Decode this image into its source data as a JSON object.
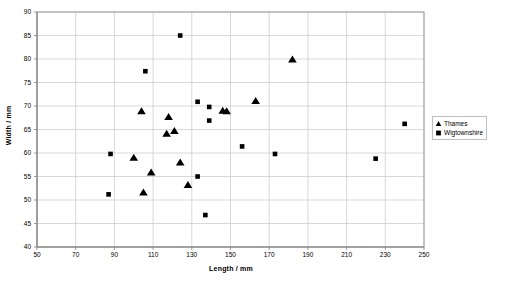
{
  "chart_data": {
    "type": "scatter",
    "title": "",
    "xlabel": "Length / mm",
    "ylabel": "Width / mm",
    "xlim": [
      50,
      250
    ],
    "ylim": [
      40,
      90
    ],
    "xticks": [
      50,
      70,
      90,
      110,
      130,
      150,
      170,
      190,
      210,
      230,
      250
    ],
    "yticks": [
      40,
      45,
      50,
      55,
      60,
      65,
      70,
      75,
      80,
      85,
      90
    ],
    "xtick_step": 20,
    "ytick_step": 5,
    "grid": true,
    "legend_position": "right",
    "series": [
      {
        "name": "Thames",
        "marker": "triangle",
        "color": "#000000",
        "points": [
          [
            104,
            68.8
          ],
          [
            100,
            58.9
          ],
          [
            109,
            55.8
          ],
          [
            105,
            51.5
          ],
          [
            118,
            67.6
          ],
          [
            117,
            64.0
          ],
          [
            121,
            64.6
          ],
          [
            124,
            57.9
          ],
          [
            128,
            53.1
          ],
          [
            148,
            68.8
          ],
          [
            146,
            68.9
          ],
          [
            163,
            71.0
          ],
          [
            182,
            79.8
          ]
        ]
      },
      {
        "name": "Wigtownshire",
        "marker": "square",
        "color": "#000000",
        "points": [
          [
            88,
            59.8
          ],
          [
            87,
            51.2
          ],
          [
            106,
            77.4
          ],
          [
            124,
            85.0
          ],
          [
            133,
            70.9
          ],
          [
            139,
            69.8
          ],
          [
            139,
            66.9
          ],
          [
            133,
            55.0
          ],
          [
            137,
            46.8
          ],
          [
            156,
            61.4
          ],
          [
            173,
            59.8
          ],
          [
            225,
            58.8
          ],
          [
            240,
            66.2
          ]
        ]
      }
    ]
  },
  "legend": {
    "items": [
      {
        "label": "Thames",
        "marker": "triangle"
      },
      {
        "label": "Wigtownshire",
        "marker": "square"
      }
    ]
  }
}
